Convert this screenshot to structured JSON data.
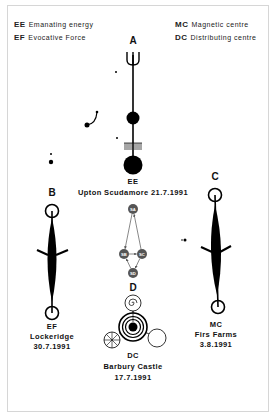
{
  "legend": [
    {
      "abbr": "EE",
      "text": "Emanating energy"
    },
    {
      "abbr": "EF",
      "text": "Evocative Force"
    },
    {
      "abbr": "MC",
      "text": "Magnetic centre"
    },
    {
      "abbr": "DC",
      "text": "Distributing centre"
    }
  ],
  "formations": {
    "A": {
      "letter": "A",
      "type": "EE",
      "place": "Upton Scudamore 21.7.1991"
    },
    "B": {
      "letter": "B",
      "type": "EF",
      "place": "Lockeridge",
      "date": "30.7.1991"
    },
    "C": {
      "letter": "C",
      "type": "MC",
      "place": "Firs Farms",
      "date": "3.8.1991"
    },
    "D": {
      "letter": "D",
      "type": "DC",
      "place": "Barbury Castle",
      "date": "17.7.1991"
    }
  },
  "flow_diagram": {
    "nodes": [
      "SA",
      "SB",
      "SC",
      "SD"
    ],
    "edges": [
      [
        "SA",
        "SB"
      ],
      [
        "SC",
        "SA"
      ],
      [
        "SB",
        "SC"
      ],
      [
        "SC",
        "SD"
      ],
      [
        "SD",
        "SB"
      ]
    ],
    "node_color": "#555555"
  }
}
